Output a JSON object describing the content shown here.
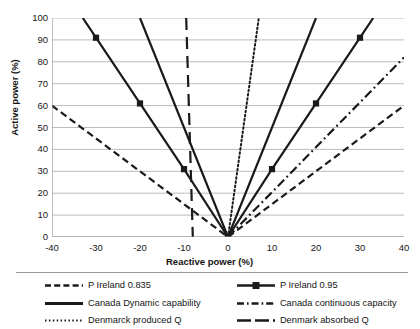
{
  "chart_data": {
    "type": "line",
    "title": "",
    "xlabel": "Reactive power (%)",
    "ylabel": "Active power (%)",
    "xlim": [
      -40,
      40
    ],
    "ylim": [
      0,
      100
    ],
    "xticks": [
      -40,
      -30,
      -20,
      -10,
      0,
      10,
      20,
      30,
      40
    ],
    "yticks": [
      0,
      10,
      20,
      30,
      40,
      50,
      60,
      70,
      80,
      90,
      100
    ],
    "grid": "horizontal",
    "legend_position": "bottom",
    "series": [
      {
        "name": "P Ireland 0.835",
        "style": "dashed",
        "marker": "none",
        "color": "#1a1a1a",
        "points": [
          [
            -40,
            60
          ],
          [
            0,
            0
          ],
          [
            40,
            60
          ]
        ]
      },
      {
        "name": "P Ireland 0.95",
        "style": "solid",
        "marker": "square",
        "color": "#1a1a1a",
        "points": [
          [
            -33,
            100
          ],
          [
            -30,
            91
          ],
          [
            -20,
            61
          ],
          [
            -10,
            31
          ],
          [
            0,
            0
          ],
          [
            10,
            31
          ],
          [
            20,
            61
          ],
          [
            30,
            91
          ],
          [
            33,
            100
          ]
        ]
      },
      {
        "name": "Canada Dynamic capability",
        "style": "solid",
        "marker": "none",
        "color": "#1a1a1a",
        "points": [
          [
            -20,
            100
          ],
          [
            0,
            0
          ],
          [
            20,
            100
          ]
        ]
      },
      {
        "name": "Canada continuous capacity",
        "style": "dash-dot",
        "marker": "none",
        "color": "#1a1a1a",
        "points": [
          [
            0,
            0
          ],
          [
            40,
            82
          ]
        ]
      },
      {
        "name": "Denmarck produced Q",
        "style": "dotted",
        "marker": "none",
        "color": "#1a1a1a",
        "points": [
          [
            0,
            0
          ],
          [
            7,
            100
          ]
        ]
      },
      {
        "name": "Denmark absorbed Q",
        "style": "long-dash",
        "marker": "none",
        "color": "#1a1a1a",
        "points": [
          [
            -9.5,
            100
          ],
          [
            -8,
            0
          ]
        ]
      }
    ]
  },
  "axes": {
    "x_title": "Reactive power (%)",
    "y_title": "Active power (%)",
    "x_tick_labels": [
      "-40",
      "-30",
      "-20",
      "-10",
      "0",
      "10",
      "20",
      "30",
      "40"
    ],
    "y_tick_labels": [
      "0",
      "10",
      "20",
      "30",
      "40",
      "50",
      "60",
      "70",
      "80",
      "90",
      "100"
    ]
  },
  "legend": {
    "left": [
      {
        "label": "P Ireland 0.835",
        "swatch": "dashed-line-swatch"
      },
      {
        "label": "Canada Dynamic capability",
        "swatch": "solid-line-swatch"
      },
      {
        "label": "Denmarck produced Q",
        "swatch": "dotted-line-swatch"
      }
    ],
    "right": [
      {
        "label": "P Ireland 0.95",
        "swatch": "solid-square-marker-line-swatch"
      },
      {
        "label": "Canada continuous capacity",
        "swatch": "dash-dot-line-swatch"
      },
      {
        "label": "Denmark absorbed Q",
        "swatch": "long-dash-line-swatch"
      }
    ]
  }
}
